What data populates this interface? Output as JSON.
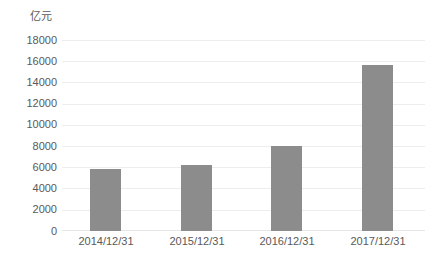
{
  "chart_data": {
    "type": "bar",
    "title": "",
    "subtitle": "",
    "unit_label": "亿元",
    "xlabel": "",
    "ylabel": "亿元",
    "categories": [
      "2014/12/31",
      "2015/12/31",
      "2016/12/31",
      "2017/12/31"
    ],
    "values": [
      5850,
      6230,
      8100,
      15750
    ],
    "series": [
      {
        "name": "",
        "values": [
          5850,
          6230,
          8100,
          15750
        ]
      }
    ],
    "ylim": [
      0,
      18000
    ],
    "ytick_step": 2000,
    "ytick_labels": [
      "18000",
      "16000",
      "14000",
      "12000",
      "10000",
      "8000",
      "6000",
      "4000",
      "2000",
      "0"
    ],
    "ytick_values": [
      18000,
      16000,
      14000,
      12000,
      10000,
      8000,
      6000,
      4000,
      2000,
      0
    ],
    "grid": {
      "horizontal": true,
      "vertical": false
    },
    "legend": {
      "visible": false,
      "position": "none",
      "entries": []
    },
    "annotations": [],
    "colors": {
      "bar": "#8c8c8c",
      "gridline": "#ededed",
      "baseline": "#e6e6e6",
      "text": "#595959",
      "background": "#ffffff"
    }
  }
}
